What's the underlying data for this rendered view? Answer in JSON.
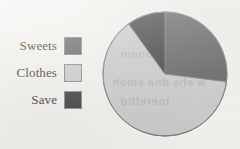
{
  "page": {
    "background_color": "#f3f1ed"
  },
  "legend": {
    "position": "left",
    "items": [
      {
        "label": "Sweets",
        "color": "#535353",
        "swatch_name": "legend-swatch-sweets"
      },
      {
        "label": "Clothes",
        "color": "#c6c6c6",
        "swatch_name": "legend-swatch-clothes"
      },
      {
        "label": "Save",
        "color": "#2c2c2c",
        "swatch_name": "legend-swatch-save"
      }
    ]
  },
  "ghost_text": {
    "line1": "ni yonom",
    "line2": "w ehs dna emoh",
    "line3": "tnereffid"
  },
  "chart_data": {
    "type": "pie",
    "title": "",
    "categories": [
      "Sweets",
      "Clothes",
      "Save"
    ],
    "values": [
      27,
      63,
      10
    ],
    "unit": "percent",
    "colors": [
      "#535353",
      "#c6c6c6",
      "#2c2c2c"
    ],
    "start_angle_deg": 0,
    "direction": "clockwise",
    "legend_position": "left",
    "grid": false,
    "labels_shown": false,
    "center_px": [
      63,
      63
    ],
    "radius_px": 62,
    "stroke_color": "#6e6e6e"
  }
}
